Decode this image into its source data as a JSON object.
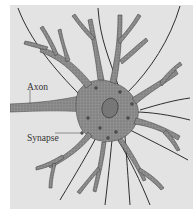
{
  "figure": {
    "background_color": "#e3e3e3",
    "cell_color": "#8a8a8a",
    "fiber_color": "#1a1a1a",
    "labels": [
      {
        "id": "axon",
        "text": "Axon"
      },
      {
        "id": "synapse",
        "text": "Synapse"
      }
    ]
  }
}
